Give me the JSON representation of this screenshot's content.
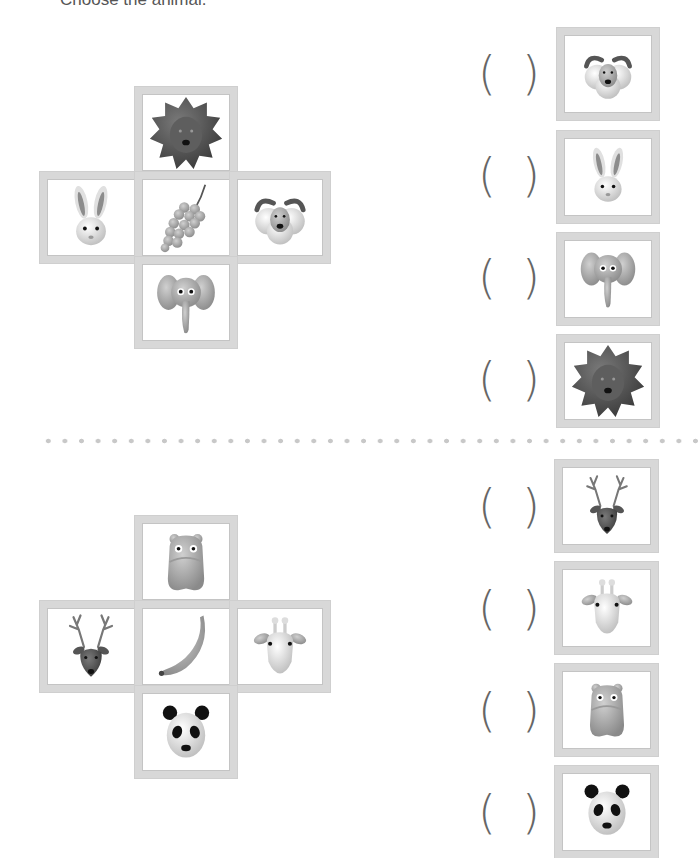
{
  "instruction": "Choose the animal.",
  "puzzles": [
    {
      "grid": {
        "top": "lion",
        "left": "rabbit",
        "center": "grapes",
        "right": "ram",
        "bottom": "elephant"
      },
      "options": [
        {
          "answer": "",
          "animal": "ram",
          "paren_open": "(",
          "paren_close": ")"
        },
        {
          "answer": "",
          "animal": "rabbit",
          "paren_open": "(",
          "paren_close": ")"
        },
        {
          "answer": "",
          "animal": "elephant",
          "paren_open": "(",
          "paren_close": ")"
        },
        {
          "answer": "",
          "animal": "lion",
          "paren_open": "(",
          "paren_close": ")"
        }
      ]
    },
    {
      "grid": {
        "top": "hippo",
        "left": "deer",
        "center": "banana",
        "right": "giraffe",
        "bottom": "panda"
      },
      "options": [
        {
          "answer": "",
          "animal": "deer",
          "paren_open": "(",
          "paren_close": ")"
        },
        {
          "answer": "",
          "animal": "giraffe",
          "paren_open": "(",
          "paren_close": ")"
        },
        {
          "answer": "",
          "animal": "hippo",
          "paren_open": "(",
          "paren_close": ")"
        },
        {
          "answer": "",
          "animal": "panda",
          "paren_open": "(",
          "paren_close": ")"
        }
      ]
    }
  ],
  "colors": {
    "frame": "#d8d8d8",
    "paren": "#666666",
    "divider_dots": "#c8c8c8"
  }
}
